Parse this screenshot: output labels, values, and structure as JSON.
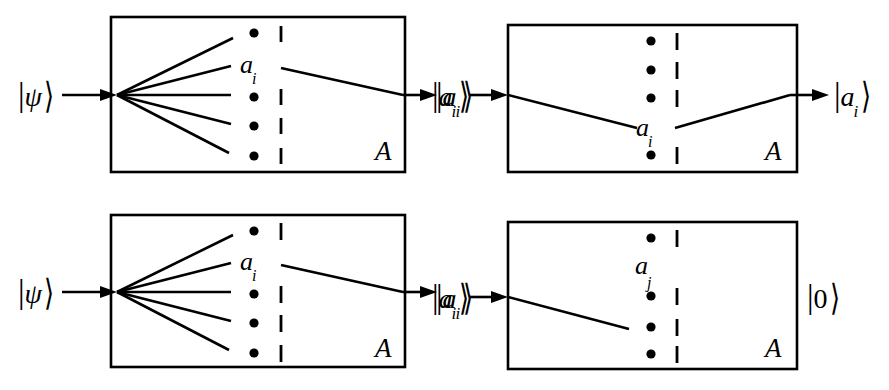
{
  "figure": {
    "ink_color": "#000000",
    "background_color": "#ffffff",
    "width": 889,
    "height": 390
  },
  "panels": [
    {
      "id": "top-left",
      "box_label": "A",
      "inner_label": "a",
      "inner_label_sub": "i",
      "input_ket": {
        "bar": "|",
        "symbol": "ψ",
        "sub": "",
        "angle": "⟩"
      },
      "output_ket": {
        "bar": "|",
        "symbol": "a",
        "sub": "i",
        "angle": "⟩"
      },
      "input_label_text": "|ψ⟩",
      "output_label_text": "|aᵢ⟩",
      "fan_rays": 5,
      "dot_count": 4,
      "dash_count": 4,
      "description": "Superposition fans out into many branches; one branch a_i exits"
    },
    {
      "id": "top-right",
      "box_label": "A",
      "inner_label": "a",
      "inner_label_sub": "i",
      "input_ket": {
        "bar": "|",
        "symbol": "a",
        "sub": "i",
        "angle": "⟩"
      },
      "output_ket": {
        "bar": "|",
        "symbol": "a",
        "sub": "i",
        "angle": "⟩"
      },
      "input_label_text": "|aᵢ⟩",
      "output_label_text": "|aᵢ⟩",
      "fan_rays": 1,
      "dot_count": 4,
      "dash_count": 4,
      "description": "Eigenstate a_i enters, is detected at a_i, and exits unchanged"
    },
    {
      "id": "bottom-left",
      "box_label": "A",
      "inner_label": "a",
      "inner_label_sub": "i",
      "input_ket": {
        "bar": "|",
        "symbol": "ψ",
        "sub": "",
        "angle": "⟩"
      },
      "output_ket": {
        "bar": "|",
        "symbol": "a",
        "sub": "i",
        "angle": "⟩"
      },
      "input_label_text": "|ψ⟩",
      "output_label_text": "|aᵢ⟩",
      "fan_rays": 5,
      "dot_count": 4,
      "dash_count": 4,
      "description": "Superposition fans out into many branches; one branch a_i exits"
    },
    {
      "id": "bottom-right",
      "box_label": "A",
      "inner_label": "a",
      "inner_label_sub": "j",
      "input_ket": {
        "bar": "|",
        "symbol": "a",
        "sub": "i",
        "angle": "⟩"
      },
      "output_ket": {
        "bar": "|",
        "symbol": "0",
        "sub": "",
        "angle": "⟩"
      },
      "input_label_text": "|aᵢ⟩",
      "output_label_text": "|0⟩",
      "fan_rays": 1,
      "dot_count": 4,
      "dash_count": 4,
      "description": "Eigenstate a_i enters but is not detected at a_j; null result"
    }
  ]
}
